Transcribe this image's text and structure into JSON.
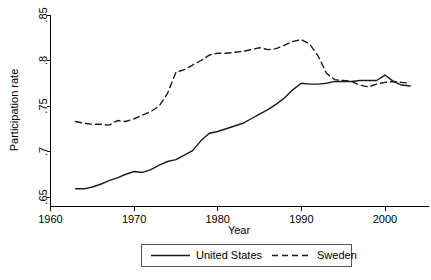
{
  "chart_data": {
    "type": "line",
    "title": "",
    "xlabel": "Year",
    "ylabel": "Participation rate",
    "xlim": [
      1960,
      2004
    ],
    "ylim": [
      0.645,
      0.855
    ],
    "xticks": [
      1960,
      1970,
      1980,
      1990,
      2000
    ],
    "xticklabels": [
      "1960",
      "1970",
      "1980",
      "1990",
      "2000"
    ],
    "yticks": [
      0.65,
      0.7,
      0.75,
      0.8,
      0.85
    ],
    "yticklabels": [
      ".65",
      ".7",
      ".75",
      ".8",
      ".85"
    ],
    "grid": false,
    "legend_position": "bottom-center",
    "series": [
      {
        "name": "United States",
        "style": "solid",
        "color": "#1a1a1a",
        "x": [
          1963,
          1964,
          1965,
          1966,
          1967,
          1968,
          1969,
          1970,
          1971,
          1972,
          1973,
          1974,
          1975,
          1976,
          1977,
          1978,
          1979,
          1980,
          1981,
          1982,
          1983,
          1984,
          1985,
          1986,
          1987,
          1988,
          1989,
          1990,
          1991,
          1992,
          1993,
          1994,
          1995,
          1996,
          1997,
          1998,
          1999,
          2000,
          2001,
          2002,
          2003
        ],
        "values": [
          0.659,
          0.659,
          0.661,
          0.664,
          0.668,
          0.671,
          0.675,
          0.678,
          0.677,
          0.68,
          0.685,
          0.689,
          0.691,
          0.696,
          0.701,
          0.712,
          0.72,
          0.722,
          0.725,
          0.728,
          0.731,
          0.736,
          0.741,
          0.746,
          0.752,
          0.759,
          0.768,
          0.775,
          0.774,
          0.774,
          0.775,
          0.777,
          0.777,
          0.777,
          0.778,
          0.778,
          0.778,
          0.784,
          0.777,
          0.773,
          0.772
        ]
      },
      {
        "name": "Sweden",
        "style": "dashed",
        "color": "#1a1a1a",
        "x": [
          1963,
          1964,
          1965,
          1966,
          1967,
          1968,
          1969,
          1970,
          1971,
          1972,
          1973,
          1974,
          1975,
          1976,
          1977,
          1978,
          1979,
          1980,
          1981,
          1982,
          1983,
          1984,
          1985,
          1986,
          1987,
          1988,
          1989,
          1990,
          1991,
          1992,
          1993,
          1994,
          1995,
          1996,
          1997,
          1998,
          1999,
          2000,
          2001,
          2002,
          2003
        ],
        "values": [
          0.733,
          0.731,
          0.73,
          0.73,
          0.729,
          0.734,
          0.733,
          0.736,
          0.74,
          0.744,
          0.75,
          0.764,
          0.787,
          0.79,
          0.795,
          0.8,
          0.806,
          0.808,
          0.808,
          0.809,
          0.81,
          0.812,
          0.814,
          0.812,
          0.813,
          0.817,
          0.821,
          0.823,
          0.818,
          0.805,
          0.786,
          0.779,
          0.778,
          0.777,
          0.773,
          0.771,
          0.774,
          0.776,
          0.777,
          0.776,
          0.775
        ]
      }
    ]
  },
  "legend": {
    "items": [
      {
        "label": "United States",
        "style": "solid"
      },
      {
        "label": "Sweden",
        "style": "dashed"
      }
    ]
  }
}
